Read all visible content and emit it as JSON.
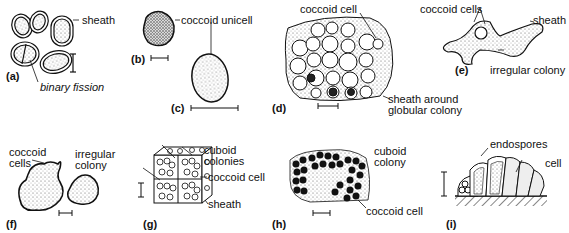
{
  "figure": {
    "panels": [
      {
        "id": "a",
        "letter": "(a)",
        "labels": {
          "sheath": "sheath",
          "fission": "binary fission"
        }
      },
      {
        "id": "b",
        "letter": "(b)",
        "labels": {
          "unicell": "coccoid unicell"
        }
      },
      {
        "id": "c",
        "letter": "(c)"
      },
      {
        "id": "d",
        "letter": "(d)",
        "labels": {
          "cell": "coccoid cell",
          "sheath1": "sheath around",
          "sheath2": "globular colony"
        }
      },
      {
        "id": "e",
        "letter": "(e)",
        "labels": {
          "cells": "coccoid cells",
          "sheath": "sheath",
          "colony": "irregular colony"
        }
      },
      {
        "id": "f",
        "letter": "(f)",
        "labels": {
          "cells1": "coccoid",
          "cells2": "cells",
          "colony1": "irregular",
          "colony2": "colony"
        }
      },
      {
        "id": "g",
        "letter": "(g)",
        "labels": {
          "colonies1": "cuboid",
          "colonies2": "colonies",
          "cell": "coccoid cell",
          "sheath": "sheath"
        }
      },
      {
        "id": "h",
        "letter": "(h)",
        "labels": {
          "colony1": "cuboid",
          "colony2": "colony",
          "cell": "coccoid cell"
        }
      },
      {
        "id": "i",
        "letter": "(i)",
        "labels": {
          "endospores": "endospores",
          "cell": "cell"
        }
      }
    ]
  }
}
